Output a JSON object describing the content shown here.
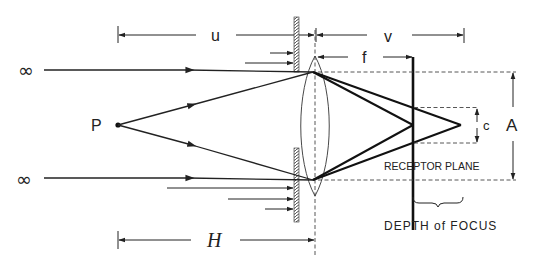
{
  "diagram": {
    "labels": {
      "u": "u",
      "v": "v",
      "f": "f",
      "c": "c",
      "A": "A",
      "H": "H",
      "P": "P",
      "infinity_top": "∞",
      "infinity_bottom": "∞",
      "receptor_plane": "RECEPTOR PLANE",
      "depth_of_focus": "DEPTH of FOCUS"
    },
    "elements": {
      "object_point": "P",
      "lens": "biconvex-lens",
      "aperture": "hatched-aperture-stop",
      "receptor": "receptor-plane",
      "dimensions": [
        "u",
        "v",
        "f",
        "c",
        "A",
        "H"
      ]
    },
    "colors": {
      "ink": "#222222",
      "background": "#ffffff"
    }
  }
}
